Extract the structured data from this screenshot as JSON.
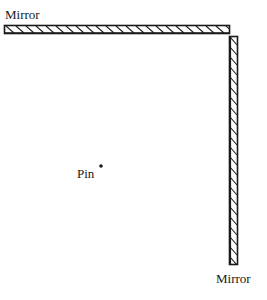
{
  "diagram": {
    "type": "two perpendicular plane mirrors with a pin",
    "labels": {
      "top_mirror": "Mirror",
      "right_mirror": "Mirror",
      "pin": "Pin"
    },
    "colors": {
      "stroke": "#1a1a1a",
      "background": "#ffffff"
    },
    "elements": {
      "top_mirror": {
        "x": 4,
        "y": 25,
        "width": 226,
        "height": 9,
        "orientation": "horizontal"
      },
      "right_mirror": {
        "x": 229,
        "y": 36,
        "width": 9,
        "height": 229,
        "orientation": "vertical"
      },
      "pin": {
        "cx": 101,
        "cy": 166,
        "r": 1.8
      }
    }
  }
}
